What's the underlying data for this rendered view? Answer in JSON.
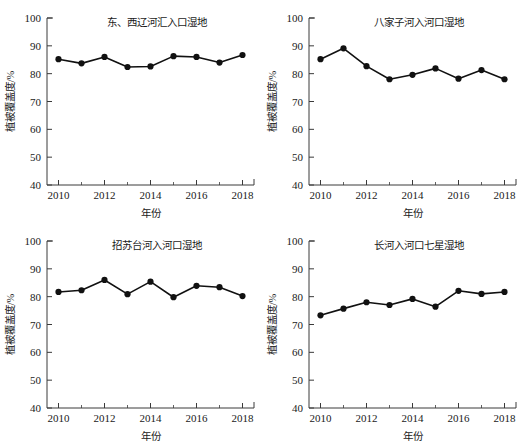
{
  "figure": {
    "background": "#ffffff",
    "marker_color": "#111111",
    "line_color": "#111111",
    "axis_color": "#3a3a3a",
    "panel_count": 4
  },
  "axes_common": {
    "xlabel": "年份",
    "ylabel": "植被覆盖度/%",
    "xlim": [
      2009.5,
      2018.5
    ],
    "ylim": [
      40,
      100
    ],
    "ytick_labels": [
      "40",
      "50",
      "60",
      "70",
      "80",
      "90",
      "100"
    ],
    "yticks": [
      40,
      50,
      60,
      70,
      80,
      90,
      100
    ],
    "xtick_labels": [
      "2010",
      "2012",
      "2014",
      "2016",
      "2018"
    ],
    "xticks": [
      2010,
      2012,
      2014,
      2016,
      2018
    ],
    "xminor_ticks": [
      2011,
      2013,
      2015,
      2017
    ],
    "grid": "off",
    "legend": "none"
  },
  "chart_data": [
    {
      "type": "line",
      "panel": "top-left",
      "title": "东、西辽河汇入口湿地",
      "xlabel": "年份",
      "ylabel": "植被覆盖度/%",
      "xlim": [
        2009.5,
        2018.5
      ],
      "ylim": [
        40,
        100
      ],
      "categories": [
        2010,
        2011,
        2012,
        2013,
        2014,
        2015,
        2016,
        2017,
        2018
      ],
      "values": [
        85.2,
        83.7,
        86.0,
        82.4,
        82.6,
        86.3,
        86.0,
        84.0,
        86.7
      ]
    },
    {
      "type": "line",
      "panel": "top-right",
      "title": "八家子河入河口湿地",
      "xlabel": "年份",
      "ylabel": "植被覆盖度/%",
      "xlim": [
        2009.5,
        2018.5
      ],
      "ylim": [
        40,
        100
      ],
      "categories": [
        2010,
        2011,
        2012,
        2013,
        2014,
        2015,
        2016,
        2017,
        2018
      ],
      "values": [
        85.2,
        89.1,
        82.7,
        78.0,
        79.6,
        81.9,
        78.2,
        81.3,
        78.0
      ]
    },
    {
      "type": "line",
      "panel": "bottom-left",
      "title": "招苏台河入河口湿地",
      "xlabel": "年份",
      "ylabel": "植被覆盖度/%",
      "xlim": [
        2009.5,
        2018.5
      ],
      "ylim": [
        40,
        100
      ],
      "categories": [
        2010,
        2011,
        2012,
        2013,
        2014,
        2015,
        2016,
        2017,
        2018
      ],
      "values": [
        81.7,
        82.3,
        86.0,
        80.9,
        85.4,
        79.8,
        83.9,
        83.4,
        80.2
      ]
    },
    {
      "type": "line",
      "panel": "bottom-right",
      "title": "长河入河口七星湿地",
      "xlabel": "年份",
      "ylabel": "植被覆盖度/%",
      "xlim": [
        2009.5,
        2018.5
      ],
      "ylim": [
        40,
        100
      ],
      "categories": [
        2010,
        2011,
        2012,
        2013,
        2014,
        2015,
        2016,
        2017,
        2018
      ],
      "values": [
        73.3,
        75.7,
        78.0,
        77.0,
        79.2,
        76.4,
        82.1,
        81.0,
        81.7
      ]
    }
  ]
}
